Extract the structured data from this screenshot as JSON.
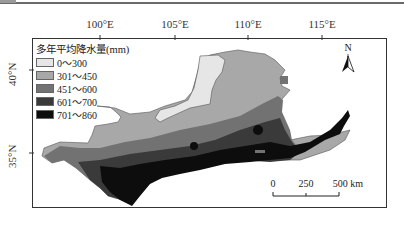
{
  "map": {
    "legend": {
      "title": "多年平均降水量(mm)",
      "items": [
        {
          "label": "0～300",
          "color": "#e6e6e6"
        },
        {
          "label": "301～450",
          "color": "#a8a8a8"
        },
        {
          "label": "451～600",
          "color": "#727272"
        },
        {
          "label": "601～700",
          "color": "#3a3a3a"
        },
        {
          "label": "701～860",
          "color": "#0d0d0d"
        }
      ]
    },
    "axes": {
      "longitude_ticks": [
        "100°E",
        "105°E",
        "110°E",
        "115°E"
      ],
      "latitude_ticks": [
        "40°N",
        "35°N"
      ]
    },
    "north_arrow": {
      "label": "N"
    },
    "scale_bar": {
      "labels": [
        "0",
        "250",
        "500 km"
      ]
    }
  }
}
